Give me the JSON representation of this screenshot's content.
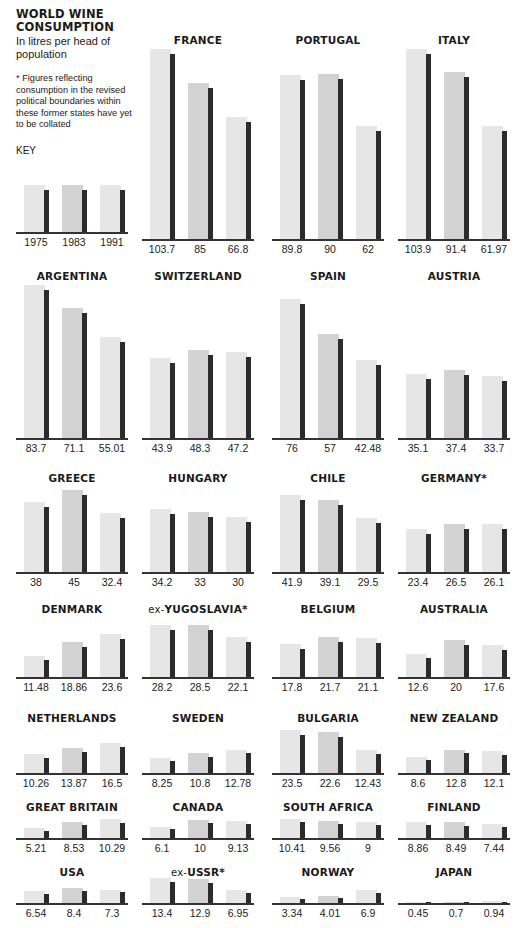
{
  "intro": {
    "title_line1": "WORLD WINE",
    "title_line2": "CONSUMPTION",
    "subtitle": "In litres per head of population",
    "footnote": "* Figures reflecting consumption in the revised political boundaries within these former states have yet to be collated",
    "key_label": "KEY",
    "key_years": [
      "1975",
      "1983",
      "1991"
    ]
  },
  "colors": {
    "bar_1975": "#e6e6e6",
    "bar_1983": "#d2d2d2",
    "bar_1991": "#e0e0e0",
    "shadow": "#2b2b2b",
    "baseline": "#333333"
  },
  "chart_data": {
    "type": "bar",
    "title": "WORLD WINE CONSUMPTION",
    "subtitle": "In litres per head of population",
    "ylabel": "Litres per head",
    "categories": [
      "1975",
      "1983",
      "1991"
    ],
    "legend": [
      "1975",
      "1983",
      "1991"
    ],
    "grid": false,
    "annotation": "* Figures reflecting consumption in the revised political boundaries within these former states have yet to be collated",
    "countries": [
      {
        "name": "FRANCE",
        "values": [
          103.7,
          85,
          66.8
        ],
        "labels": [
          "103.7",
          "85",
          "66.8"
        ]
      },
      {
        "name": "PORTUGAL",
        "values": [
          89.8,
          90,
          62
        ],
        "labels": [
          "89.8",
          "90",
          "62"
        ]
      },
      {
        "name": "ITALY",
        "values": [
          103.9,
          91.4,
          61.97
        ],
        "labels": [
          "103.9",
          "91.4",
          "61.97"
        ]
      },
      {
        "name": "ARGENTINA",
        "values": [
          83.7,
          71.1,
          55.01
        ],
        "labels": [
          "83.7",
          "71.1",
          "55.01"
        ]
      },
      {
        "name": "SWITZERLAND",
        "values": [
          43.9,
          48.3,
          47.2
        ],
        "labels": [
          "43.9",
          "48.3",
          "47.2"
        ]
      },
      {
        "name": "SPAIN",
        "values": [
          76,
          57,
          42.48
        ],
        "labels": [
          "76",
          "57",
          "42.48"
        ]
      },
      {
        "name": "AUSTRIA",
        "values": [
          35.1,
          37.4,
          33.7
        ],
        "labels": [
          "35.1",
          "37.4",
          "33.7"
        ]
      },
      {
        "name": "GREECE",
        "values": [
          38,
          45,
          32.4
        ],
        "labels": [
          "38",
          "45",
          "32.4"
        ]
      },
      {
        "name": "HUNGARY",
        "values": [
          34.2,
          33,
          30
        ],
        "labels": [
          "34.2",
          "33",
          "30"
        ]
      },
      {
        "name": "CHILE",
        "values": [
          41.9,
          39.1,
          29.5
        ],
        "labels": [
          "41.9",
          "39.1",
          "29.5"
        ]
      },
      {
        "name": "GERMANY*",
        "values": [
          23.4,
          26.5,
          26.1
        ],
        "labels": [
          "23.4",
          "26.5",
          "26.1"
        ]
      },
      {
        "name": "DENMARK",
        "values": [
          11.48,
          18.86,
          23.6
        ],
        "labels": [
          "11.48",
          "18.86",
          "23.6"
        ]
      },
      {
        "name": "ex-YUGOSLAVIA*",
        "values": [
          28.2,
          28.5,
          22.1
        ],
        "labels": [
          "28.2",
          "28.5",
          "22.1"
        ]
      },
      {
        "name": "BELGIUM",
        "values": [
          17.8,
          21.7,
          21.1
        ],
        "labels": [
          "17.8",
          "21.7",
          "21.1"
        ]
      },
      {
        "name": "AUSTRALIA",
        "values": [
          12.6,
          20,
          17.6
        ],
        "labels": [
          "12.6",
          "20",
          "17.6"
        ]
      },
      {
        "name": "NETHERLANDS",
        "values": [
          10.26,
          13.87,
          16.5
        ],
        "labels": [
          "10.26",
          "13.87",
          "16.5"
        ]
      },
      {
        "name": "SWEDEN",
        "values": [
          8.25,
          10.8,
          12.78
        ],
        "labels": [
          "8.25",
          "10.8",
          "12.78"
        ]
      },
      {
        "name": "BULGARIA",
        "values": [
          23.5,
          22.6,
          12.43
        ],
        "labels": [
          "23.5",
          "22.6",
          "12.43"
        ]
      },
      {
        "name": "NEW ZEALAND",
        "values": [
          8.6,
          12.8,
          12.1
        ],
        "labels": [
          "8.6",
          "12.8",
          "12.1"
        ]
      },
      {
        "name": "GREAT BRITAIN",
        "values": [
          5.21,
          8.53,
          10.29
        ],
        "labels": [
          "5.21",
          "8.53",
          "10.29"
        ]
      },
      {
        "name": "CANADA",
        "values": [
          6.1,
          10,
          9.13
        ],
        "labels": [
          "6.1",
          "10",
          "9.13"
        ]
      },
      {
        "name": "SOUTH AFRICA",
        "values": [
          10.41,
          9.56,
          9
        ],
        "labels": [
          "10.41",
          "9.56",
          "9"
        ]
      },
      {
        "name": "FINLAND",
        "values": [
          8.86,
          8.49,
          7.44
        ],
        "labels": [
          "8.86",
          "8.49",
          "7.44"
        ]
      },
      {
        "name": "USA",
        "values": [
          6.54,
          8.4,
          7.3
        ],
        "labels": [
          "6.54",
          "8.4",
          "7.3"
        ]
      },
      {
        "name": "ex-USSR*",
        "values": [
          13.4,
          12.9,
          6.95
        ],
        "labels": [
          "13.4",
          "12.9",
          "6.95"
        ]
      },
      {
        "name": "NORWAY",
        "values": [
          3.34,
          4.01,
          6.9
        ],
        "labels": [
          "3.34",
          "4.01",
          "6.9"
        ]
      },
      {
        "name": "JAPAN",
        "values": [
          0.45,
          0.7,
          0.94
        ],
        "labels": [
          "0.45",
          "0.7",
          "0.94"
        ]
      }
    ]
  }
}
